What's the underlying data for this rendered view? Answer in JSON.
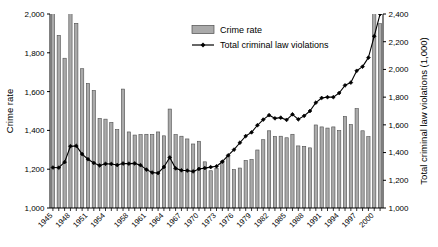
{
  "chart_data": {
    "type": "bar",
    "title": "",
    "subtitle": "",
    "xlabel": "",
    "ylabel": "Crime rate",
    "y2label": "Total criminal law violations (1,000)",
    "grid": false,
    "legend_position": "top-center",
    "ylim": [
      1000,
      2000
    ],
    "y2lim": [
      1000,
      2400
    ],
    "xlim": [
      1945,
      2001
    ],
    "yticks": [
      "1,000",
      "1,200",
      "1,400",
      "1,600",
      "1,800",
      "2,000"
    ],
    "ytick_values": [
      1000,
      1200,
      1400,
      1600,
      1800,
      2000
    ],
    "y2ticks": [
      "1,000",
      "1,200",
      "1,400",
      "1,600",
      "1,800",
      "2,000",
      "2,200",
      "2,400"
    ],
    "y2tick_values": [
      1000,
      1200,
      1400,
      1600,
      1800,
      2000,
      2200,
      2400
    ],
    "xtick_labels": [
      "1945",
      "1948",
      "1951",
      "1954",
      "1958",
      "1961",
      "1964",
      "1967",
      "1970",
      "1973",
      "1976",
      "1979",
      "1982",
      "1985",
      "1988",
      "1991",
      "1994",
      "1997",
      "2000"
    ],
    "xtick_years": [
      1945,
      1948,
      1951,
      1954,
      1958,
      1961,
      1964,
      1967,
      1970,
      1973,
      1976,
      1979,
      1982,
      1985,
      1988,
      1991,
      1994,
      1997,
      2000
    ],
    "categories": [
      1945,
      1946,
      1947,
      1948,
      1949,
      1950,
      1951,
      1952,
      1953,
      1954,
      1955,
      1956,
      1957,
      1958,
      1959,
      1960,
      1961,
      1962,
      1963,
      1964,
      1965,
      1966,
      1967,
      1968,
      1969,
      1970,
      1971,
      1972,
      1973,
      1974,
      1975,
      1976,
      1977,
      1978,
      1979,
      1980,
      1981,
      1982,
      1983,
      1984,
      1985,
      1986,
      1987,
      1988,
      1989,
      1990,
      1991,
      1992,
      1993,
      1994,
      1995,
      1996,
      1997,
      1998,
      1999,
      2000,
      2001
    ],
    "series": [
      {
        "name": "Crime rate",
        "kind": "bar",
        "axis": "left",
        "color": "#aaaaaa",
        "edge_color": "#4d4d4d",
        "values": [
          2120,
          1890,
          1772,
          2002,
          1952,
          1718,
          1642,
          1606,
          1462,
          1458,
          1441,
          1404,
          1613,
          1392,
          1376,
          1378,
          1380,
          1379,
          1392,
          1372,
          1510,
          1378,
          1370,
          1356,
          1330,
          1344,
          1238,
          1192,
          1204,
          1242,
          1268,
          1198,
          1206,
          1245,
          1250,
          1299,
          1352,
          1398,
          1369,
          1370,
          1362,
          1380,
          1320,
          1318,
          1310,
          1428,
          1418,
          1412,
          1418,
          1399,
          1472,
          1430,
          1512,
          1398,
          1368,
          2240,
          1950
        ]
      },
      {
        "name": "Total criminal law violations",
        "kind": "line",
        "axis": "right",
        "color": "#000000",
        "marker": "diamond",
        "values": [
          1292,
          1291,
          1331,
          1446,
          1448,
          1389,
          1352,
          1325,
          1307,
          1319,
          1318,
          1310,
          1321,
          1320,
          1322,
          1309,
          1277,
          1256,
          1252,
          1296,
          1365,
          1286,
          1272,
          1270,
          1264,
          1282,
          1288,
          1295,
          1301,
          1334,
          1380,
          1421,
          1471,
          1519,
          1546,
          1597,
          1638,
          1670,
          1647,
          1652,
          1636,
          1676,
          1640,
          1665,
          1700,
          1760,
          1794,
          1800,
          1800,
          1830,
          1885,
          1905,
          1990,
          2020,
          2085,
          2240,
          2400
        ]
      }
    ]
  },
  "legend": {
    "items": [
      {
        "label": "Crime rate",
        "type": "bar",
        "color": "#aaaaaa"
      },
      {
        "label": "Total criminal law violations",
        "type": "line",
        "color": "#000000"
      }
    ]
  },
  "axes": {
    "left_title": "Crime rate",
    "right_title": "Total criminal law violations (1,000)"
  }
}
